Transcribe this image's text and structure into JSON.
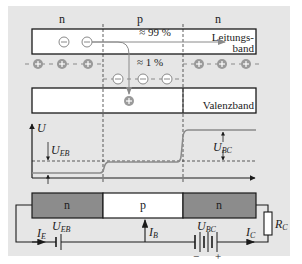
{
  "diagram": {
    "colors": {
      "background": "#e6e6e6",
      "band_fill": "#ffffff",
      "n_region_fill": "#8c8c8c",
      "p_region_fill": "#ffffff",
      "hole_fill": "#9a9a9a",
      "line": "#1a1a1a",
      "curve": "#8a8a8a"
    },
    "regions": {
      "left": "n",
      "middle": "p",
      "right": "n"
    },
    "bands": {
      "conduction_label_line1": "Leitungs-",
      "conduction_label_line2": "band",
      "valence_label": "Valenzband"
    },
    "annotations": {
      "percent_99": "≈ 99 %",
      "percent_1": "≈ 1 %"
    },
    "symbols": {
      "electron": "−",
      "hole": "+"
    },
    "graph": {
      "y_axis_label": "U",
      "u_eb_label_main": "U",
      "u_eb_label_sub": "EB",
      "u_bc_label_main": "U",
      "u_bc_label_sub": "BC"
    },
    "device": {
      "emitter": "n",
      "base": "p",
      "collector": "n"
    },
    "circuit": {
      "ie_main": "I",
      "ie_sub": "E",
      "ueb_main": "U",
      "ueb_sub": "EB",
      "ib_main": "I",
      "ib_sub": "B",
      "ubc_main": "U",
      "ubc_sub": "BC",
      "ic_main": "I",
      "ic_sub": "C",
      "rc_main": "R",
      "rc_sub": "C",
      "minus": "−",
      "plus": "+"
    }
  }
}
